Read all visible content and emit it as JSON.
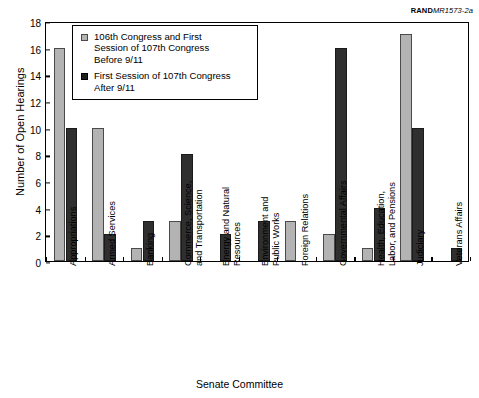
{
  "credit": {
    "brand": "RAND",
    "doc": "MR1573-2a"
  },
  "chart_data": {
    "type": "bar",
    "title": "",
    "xlabel": "Senate Committee",
    "ylabel": "Number of Open Hearings",
    "ylim": [
      0,
      18
    ],
    "yticks": [
      0,
      2,
      4,
      6,
      8,
      10,
      12,
      14,
      16,
      18
    ],
    "grid": false,
    "legend_position": "upper-left-inside",
    "categories": [
      "Appropriations",
      "Armed Services",
      "Banking",
      "Commerce, Science,\nand Transportation",
      "Energy and Natural\nResources",
      "Environment and\nPublic Works",
      "Foreign Relations",
      "Governmental Affairs",
      "Health, Education,\nLabor, and Pensions",
      "Judiciary",
      "Veterans Affairs"
    ],
    "series": [
      {
        "name": "106th Congress and First\nSession of 107th Congress\nBefore 9/11",
        "color": "#b3b3b3",
        "values": [
          16,
          10,
          1,
          3,
          0,
          0,
          3,
          2,
          1,
          17,
          0
        ]
      },
      {
        "name": "First Session of 107th Congress\nAfter 9/11",
        "color": "#2f2f2f",
        "values": [
          10,
          2,
          3,
          8,
          2,
          3,
          0,
          16,
          4,
          10,
          1
        ]
      }
    ]
  }
}
